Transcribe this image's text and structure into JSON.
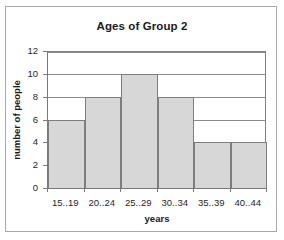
{
  "chart_data": {
    "type": "bar",
    "title": "Ages of Group 2",
    "xlabel": "years",
    "ylabel": "number of people",
    "categories": [
      "15..19",
      "20..24",
      "25..29",
      "30..34",
      "35..39",
      "40..44"
    ],
    "values": [
      6,
      8,
      10,
      8,
      4,
      4
    ],
    "ylim": [
      0,
      12
    ],
    "yticks": [
      0,
      2,
      4,
      6,
      8,
      10,
      12
    ],
    "ytick_labels": [
      "0",
      "2",
      "4",
      "6",
      "8",
      "10",
      "12"
    ],
    "grid": true,
    "grid_axis": "y",
    "legend": false,
    "bar_gap": 0,
    "colors": {
      "bar_fill": "#d7d7d7",
      "bar_border": "#7d7d7d",
      "gridline": "#8c8c8c",
      "axis": "#7a7a7a",
      "plot_background": "#ffffff",
      "frame_border": "#a9a9a9",
      "text": "#1a1a1a"
    }
  }
}
